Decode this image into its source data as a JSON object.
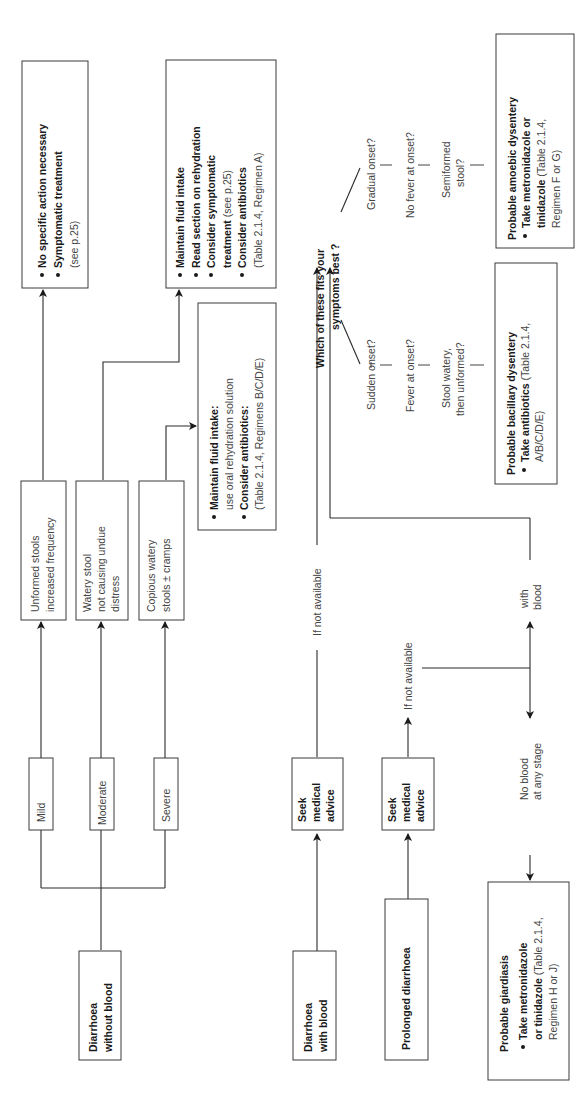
{
  "diagram": {
    "orientation": "rotated 90 degrees counter-clockwise",
    "start_nodes": {
      "without_blood": [
        "Diarrhoea",
        "without blood"
      ],
      "with_blood": [
        "Diarrhoea",
        "with blood"
      ],
      "prolonged": "Prolonged diarrhoea"
    },
    "severity": {
      "mild": "Mild",
      "moderate": "Moderate",
      "severe": "Severe"
    },
    "symptoms": {
      "mild": [
        "Unformed stools",
        "increased frequency"
      ],
      "moderate": [
        "Watery stool",
        "not causing undue",
        "distress"
      ],
      "severe": [
        "Copious watery",
        "stools ± cramps"
      ]
    },
    "outcomes": {
      "mild": {
        "bullets": [
          {
            "bold": "No specific action necessary",
            "normal": ""
          },
          {
            "bold": "Symptomatic treatment",
            "normal": ""
          }
        ],
        "extra": "(see p.25)"
      },
      "moderate": {
        "lines": [
          {
            "bold": "Maintain fluid intake",
            "normal": "",
            "bullet": true
          },
          {
            "bold": "Read section on rehydration",
            "normal": "",
            "bullet": true
          },
          {
            "bold": "Consider symptomatic",
            "normal": "",
            "bullet": true
          },
          {
            "bold": "treatment",
            "normal": " (see p.25)",
            "bullet": false
          },
          {
            "bold": "Consider antibiotics",
            "normal": "",
            "bullet": true
          },
          {
            "bold": "",
            "normal": "(Table 2.1.4, Regimen A)",
            "bullet": false
          }
        ]
      },
      "severe": {
        "lines": [
          {
            "bold": "Maintain fluid intake:",
            "normal": "",
            "bullet": true
          },
          {
            "bold": "",
            "normal": "use oral rehydration solution",
            "bullet": false
          },
          {
            "bold": "Consider antibiotics:",
            "normal": "",
            "bullet": true
          },
          {
            "bold": "",
            "normal": "(Table 2.1.4, Regimens B/C/D/E)",
            "bullet": false
          }
        ]
      }
    },
    "seek_advice": [
      "Seek",
      "medical",
      "advice"
    ],
    "if_not_available": "If not available",
    "question": [
      "Which of these fits your",
      "symptoms best ?"
    ],
    "bacillary_path": {
      "criteria": [
        "Sudden onset?",
        "Fever at onset?",
        "Stool watery,",
        "then unformed?"
      ],
      "title": "Probable bacillary dysentery",
      "bold": "Take antibiotics",
      "normal1": " (Table 2.1.4,",
      "normal2": "A/B/C/D/E)"
    },
    "amoebic_path": {
      "criteria": [
        "Gradual onset?",
        "No fever at onset?",
        "Semiformed",
        "stool?"
      ],
      "title": "Probable amoebic dysentery",
      "bold1": "Take metronidazole or",
      "bold2": "tinidazole",
      "normal1": " (Table 2.1.4,",
      "normal2": "Regimen F or G)"
    },
    "branch_labels": {
      "with_blood": [
        "with",
        "blood"
      ],
      "no_blood": [
        "No blood",
        "at any stage"
      ]
    },
    "giardiasis": {
      "title": "Probable giardiasis",
      "bold1": "Take metronidazole",
      "bold2": "or tinidazole",
      "normal1": " (Table 2.1.4,",
      "normal2": "Regimen H or J)"
    }
  }
}
